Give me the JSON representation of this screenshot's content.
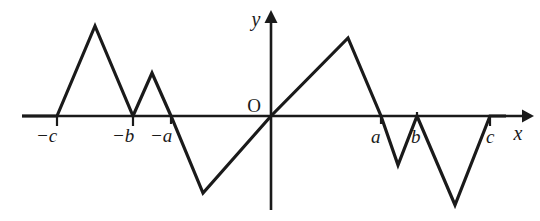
{
  "figure": {
    "background_color": "#ffffff",
    "ink_color": "#1a1a1a",
    "origin_label": "O",
    "x_axis_label": "x",
    "y_axis_label": "y"
  },
  "axes": {
    "x_axis": {
      "pixel_y": 116,
      "pixel_x_start": 22,
      "pixel_x_end": 528,
      "arrow": "right"
    },
    "y_axis": {
      "pixel_x": 271,
      "pixel_y_top": 12,
      "pixel_y_bottom": 210,
      "arrow": "up"
    }
  },
  "tick_labels": [
    {
      "name": "minus-c",
      "text": "−c",
      "pixel_x": 57,
      "label_x": 36,
      "label_y": 142
    },
    {
      "name": "minus-b",
      "text": "−b",
      "pixel_x": 133,
      "label_x": 112,
      "label_y": 142
    },
    {
      "name": "minus-a",
      "text": "−a",
      "pixel_x": 171,
      "label_x": 150,
      "label_y": 142
    },
    {
      "name": "a",
      "text": "a",
      "pixel_x": 381,
      "label_x": 371,
      "label_y": 143
    },
    {
      "name": "b",
      "text": "b",
      "pixel_x": 417,
      "label_x": 411,
      "label_y": 143
    },
    {
      "name": "c",
      "text": "c",
      "pixel_x": 490,
      "label_x": 486,
      "label_y": 143
    }
  ],
  "chart_data": {
    "type": "line",
    "title": "",
    "xlabel": "x",
    "ylabel": "y",
    "grid": false,
    "legend": null,
    "zero_crossings": [
      "-c",
      "-b",
      "-a",
      "0",
      "a",
      "b",
      "c"
    ],
    "symmetry": "odd (origin symmetric)",
    "xlim": [
      22,
      528
    ],
    "ylim": [
      210,
      12
    ],
    "vertices_pixels": [
      [
        22,
        116
      ],
      [
        57,
        116
      ],
      [
        95,
        26
      ],
      [
        133,
        116
      ],
      [
        152,
        73
      ],
      [
        171,
        116
      ],
      [
        203,
        193
      ],
      [
        271,
        116
      ],
      [
        348,
        38
      ],
      [
        381,
        116
      ],
      [
        398,
        165
      ],
      [
        417,
        116
      ],
      [
        455,
        205
      ],
      [
        490,
        116
      ],
      [
        506,
        116
      ]
    ],
    "segments": [
      {
        "from": "left end",
        "to": "-c",
        "shape": "flat on axis"
      },
      {
        "from": "-c",
        "to": "peak 1",
        "shape": "rising"
      },
      {
        "from": "peak 1",
        "to": "-b",
        "shape": "falling to axis"
      },
      {
        "from": "-b",
        "to": "peak 2",
        "shape": "rising"
      },
      {
        "from": "peak 2",
        "to": "-a",
        "shape": "falling to axis"
      },
      {
        "from": "-a",
        "to": "valley 1",
        "shape": "falling below axis"
      },
      {
        "from": "valley 1",
        "to": "origin",
        "shape": "rising to origin"
      },
      {
        "from": "origin",
        "to": "peak 3",
        "shape": "rising"
      },
      {
        "from": "peak 3",
        "to": "a",
        "shape": "falling to axis"
      },
      {
        "from": "a",
        "to": "valley 2",
        "shape": "falling below axis"
      },
      {
        "from": "valley 2",
        "to": "b",
        "shape": "rising to axis"
      },
      {
        "from": "b",
        "to": "valley 3",
        "shape": "falling below axis"
      },
      {
        "from": "valley 3",
        "to": "c",
        "shape": "rising to axis"
      },
      {
        "from": "c",
        "to": "right end",
        "shape": "flat on axis"
      }
    ],
    "extrema_pixels": {
      "peaks": [
        [
          95,
          26
        ],
        [
          152,
          73
        ],
        [
          348,
          38
        ]
      ],
      "valleys": [
        [
          203,
          193
        ],
        [
          398,
          165
        ],
        [
          455,
          205
        ]
      ]
    }
  }
}
